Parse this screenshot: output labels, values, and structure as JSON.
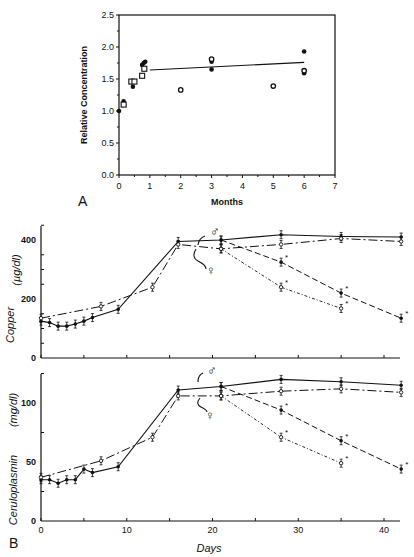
{
  "figure": {
    "panel_a_label": "A",
    "panel_b_label": "B"
  },
  "chart_data": [
    {
      "type": "scatter",
      "panel": "A",
      "title": "",
      "xlabel": "Months",
      "ylabel": "Relative Concentration",
      "xlim": [
        0,
        7
      ],
      "ylim": [
        0.0,
        2.5
      ],
      "xticks": [
        "0",
        "1",
        "2",
        "3",
        "4",
        "5",
        "6",
        "7"
      ],
      "yticks": [
        "0.0",
        "0.5",
        "1.0",
        "1.5",
        "2.0",
        "2.5"
      ],
      "grid": false,
      "series": [
        {
          "name": "filled-circle",
          "marker": "filled",
          "points": [
            [
              0,
              1.0
            ],
            [
              0.15,
              1.15
            ],
            [
              0.45,
              1.38
            ],
            [
              0.75,
              1.72
            ],
            [
              0.8,
              1.75
            ],
            [
              0.85,
              1.77
            ],
            [
              3,
              1.65
            ],
            [
              3,
              1.77
            ],
            [
              6,
              1.93
            ],
            [
              6,
              1.59
            ]
          ]
        },
        {
          "name": "open-circle",
          "marker": "open",
          "points": [
            [
              2,
              1.33
            ],
            [
              3,
              1.81
            ],
            [
              5,
              1.39
            ],
            [
              6,
              1.63
            ]
          ]
        },
        {
          "name": "open-square",
          "marker": "square",
          "points": [
            [
              0.15,
              1.1
            ],
            [
              0.4,
              1.46
            ],
            [
              0.5,
              1.46
            ],
            [
              0.75,
              1.55
            ],
            [
              0.82,
              1.66
            ]
          ]
        }
      ],
      "fit_line": {
        "x": [
          1,
          6
        ],
        "y": [
          1.64,
          1.76
        ]
      }
    },
    {
      "type": "line",
      "panel": "B-top",
      "title": "",
      "xlabel": "",
      "ylabel": "Copper (µg/dl)",
      "xlim": [
        0,
        42
      ],
      "ylim": [
        0,
        450
      ],
      "yticks": [
        "0",
        "200",
        "400"
      ],
      "grid": false,
      "annotations": [
        "♂",
        "♀",
        "*"
      ],
      "series": [
        {
          "name": "male",
          "style": "solid",
          "marker": "filled",
          "x": [
            0,
            1,
            2,
            3,
            4,
            5,
            6,
            9,
            16,
            21,
            28,
            35,
            42
          ],
          "y": [
            125,
            120,
            108,
            108,
            115,
            125,
            137,
            165,
            395,
            400,
            418,
            412,
            410
          ]
        },
        {
          "name": "female",
          "style": "dash-dot",
          "marker": "open",
          "x": [
            0,
            7,
            13,
            16,
            21,
            28,
            35,
            42
          ],
          "y": [
            135,
            175,
            240,
            385,
            370,
            385,
            405,
            395
          ]
        },
        {
          "name": "male-treated",
          "style": "dashed",
          "marker": "filled",
          "x": [
            21,
            28,
            35,
            42
          ],
          "y": [
            400,
            325,
            220,
            135
          ],
          "significant": [
            false,
            true,
            true,
            true
          ]
        },
        {
          "name": "female-treated",
          "style": "dotted-dash",
          "marker": "open",
          "x": [
            21,
            28,
            35,
            42
          ],
          "y": [
            370,
            240,
            168,
            null
          ],
          "significant": [
            false,
            true,
            true
          ]
        }
      ]
    },
    {
      "type": "line",
      "panel": "B-bottom",
      "title": "",
      "xlabel": "Days",
      "ylabel": "Ceruloplasmin (mg/dl)",
      "xlim": [
        0,
        42
      ],
      "ylim": [
        0,
        125
      ],
      "xticks": [
        "0",
        "10",
        "20",
        "30",
        "40"
      ],
      "yticks": [
        "0",
        "50",
        "100"
      ],
      "grid": false,
      "annotations": [
        "♂",
        "♀",
        "*"
      ],
      "series": [
        {
          "name": "male",
          "style": "solid",
          "marker": "filled",
          "x": [
            0,
            1,
            2,
            3,
            4,
            5,
            6,
            9,
            16,
            21,
            28,
            35,
            42
          ],
          "y": [
            35,
            35,
            32,
            35,
            35,
            44,
            41,
            46,
            111,
            114,
            120,
            118,
            115
          ]
        },
        {
          "name": "female",
          "style": "dash-dot",
          "marker": "open",
          "x": [
            0,
            7,
            13,
            16,
            21,
            28,
            35,
            42
          ],
          "y": [
            37,
            51,
            71,
            106,
            106,
            110,
            112,
            109
          ]
        },
        {
          "name": "male-treated",
          "style": "dashed",
          "marker": "filled",
          "x": [
            21,
            28,
            35,
            42
          ],
          "y": [
            114,
            94,
            68,
            44
          ],
          "significant": [
            false,
            true,
            true,
            true
          ]
        },
        {
          "name": "female-treated",
          "style": "dotted-dash",
          "marker": "open",
          "x": [
            21,
            28,
            35
          ],
          "y": [
            106,
            71,
            49
          ],
          "significant": [
            false,
            true,
            true
          ]
        }
      ]
    }
  ],
  "labels": {
    "a_ylabel": "Relative Concentration",
    "a_xlabel": "Months",
    "b_copper_ylabel": "Copper",
    "b_copper_unit": "(µg/dl)",
    "b_cp_ylabel": "Ceruloplasmin",
    "b_cp_unit": "(mg/dl)",
    "b_xlabel": "Days",
    "male_symbol": "♂",
    "female_symbol": "♀",
    "asterisk": "*",
    "a_xticks": [
      "0",
      "1",
      "2",
      "3",
      "4",
      "5",
      "6",
      "7"
    ],
    "a_yticks": [
      "0.0",
      "0.5",
      "1.0",
      "1.5",
      "2.0",
      "2.5"
    ],
    "b_xticks": [
      "0",
      "10",
      "20",
      "30",
      "40"
    ],
    "cu_yticks": [
      "0",
      "200",
      "400"
    ],
    "cp_yticks": [
      "0",
      "50",
      "100"
    ]
  }
}
